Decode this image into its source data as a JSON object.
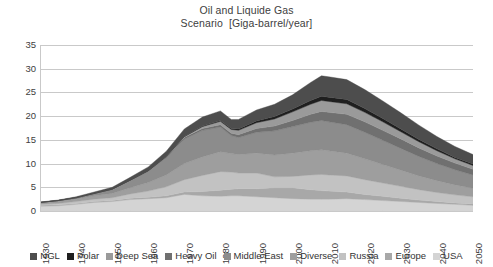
{
  "chart_data": {
    "type": "area",
    "title": "Oil and Liquide Gas",
    "subtitle": "Scenario  [Giga-barrel/year]",
    "xlabel": "",
    "ylabel": "",
    "stacked": true,
    "grid": true,
    "legend_position": "bottom",
    "xlim": [
      1930,
      2050
    ],
    "ylim": [
      0,
      35
    ],
    "yticks": [
      0,
      5,
      10,
      15,
      20,
      25,
      30,
      35
    ],
    "ytick_labels": [
      "0",
      "5",
      "10",
      "15",
      "20",
      "25",
      "30",
      "35"
    ],
    "xticks": [
      1930,
      1940,
      1950,
      1960,
      1970,
      1980,
      1990,
      2000,
      2010,
      2020,
      2030,
      2040,
      2050
    ],
    "xtick_labels": [
      "1930",
      "1940",
      "1950",
      "1960",
      "1970",
      "1980",
      "1990",
      "2000",
      "2010",
      "2020",
      "2030",
      "2040",
      "2050"
    ],
    "x": [
      1930,
      1935,
      1940,
      1945,
      1950,
      1955,
      1960,
      1965,
      1970,
      1975,
      1980,
      1983,
      1985,
      1990,
      1995,
      2000,
      2005,
      2008,
      2010,
      2015,
      2020,
      2025,
      2030,
      2035,
      2040,
      2045,
      2050
    ],
    "series": [
      {
        "name": "USA",
        "color": "#d4d4d4",
        "values": [
          1.0,
          1.1,
          1.4,
          1.8,
          2.0,
          2.4,
          2.6,
          2.8,
          3.5,
          3.2,
          3.1,
          3.2,
          3.2,
          3.0,
          2.8,
          2.6,
          2.5,
          2.5,
          2.5,
          2.6,
          2.4,
          2.2,
          2.0,
          1.8,
          1.6,
          1.4,
          1.2
        ]
      },
      {
        "name": "Europe",
        "color": "#a8a8a8",
        "values": [
          0.2,
          0.2,
          0.2,
          0.2,
          0.2,
          0.3,
          0.3,
          0.4,
          0.5,
          0.9,
          1.3,
          1.4,
          1.5,
          1.7,
          2.1,
          2.3,
          2.0,
          1.8,
          1.7,
          1.4,
          1.1,
          0.9,
          0.7,
          0.5,
          0.4,
          0.3,
          0.3
        ]
      },
      {
        "name": "Russia",
        "color": "#c2c2c2",
        "values": [
          0.2,
          0.3,
          0.4,
          0.5,
          0.6,
          0.9,
          1.3,
          1.9,
          2.6,
          3.4,
          3.9,
          3.6,
          3.3,
          3.3,
          2.3,
          2.4,
          3.1,
          3.4,
          3.4,
          3.4,
          3.1,
          2.8,
          2.5,
          2.2,
          1.9,
          1.7,
          1.5
        ]
      },
      {
        "name": "Diverse",
        "color": "#9e9e9e",
        "values": [
          0.3,
          0.4,
          0.5,
          0.7,
          0.9,
          1.3,
          1.8,
          2.5,
          3.4,
          3.9,
          4.2,
          3.9,
          3.9,
          4.2,
          4.6,
          4.9,
          5.1,
          5.2,
          5.1,
          4.8,
          4.4,
          3.9,
          3.4,
          2.9,
          2.5,
          2.1,
          1.8
        ]
      },
      {
        "name": "Middle East",
        "color": "#8c8c8c",
        "values": [
          0.1,
          0.2,
          0.3,
          0.5,
          0.9,
          1.5,
          2.4,
          3.6,
          5.2,
          5.6,
          5.2,
          3.8,
          3.6,
          4.4,
          5.1,
          5.6,
          6.0,
          6.2,
          6.1,
          6.0,
          5.6,
          5.1,
          4.6,
          4.1,
          3.6,
          3.2,
          2.8
        ]
      },
      {
        "name": "Heavy Oil",
        "color": "#707070",
        "values": [
          0.0,
          0.0,
          0.0,
          0.0,
          0.0,
          0.1,
          0.1,
          0.2,
          0.3,
          0.4,
          0.5,
          0.5,
          0.6,
          0.8,
          1.0,
          1.3,
          1.7,
          1.9,
          2.0,
          2.2,
          2.2,
          2.1,
          2.0,
          1.8,
          1.6,
          1.4,
          1.2
        ]
      },
      {
        "name": "Deep Sea",
        "color": "#9a9a9a",
        "values": [
          0.0,
          0.0,
          0.0,
          0.0,
          0.0,
          0.0,
          0.0,
          0.1,
          0.2,
          0.4,
          0.7,
          0.8,
          0.9,
          1.2,
          1.5,
          1.8,
          2.1,
          2.3,
          2.3,
          2.2,
          2.0,
          1.8,
          1.5,
          1.3,
          1.1,
          0.9,
          0.8
        ]
      },
      {
        "name": "Polar",
        "color": "#1f1f1f",
        "values": [
          0.0,
          0.0,
          0.0,
          0.0,
          0.0,
          0.0,
          0.0,
          0.0,
          0.0,
          0.1,
          0.2,
          0.2,
          0.3,
          0.4,
          0.5,
          0.6,
          0.8,
          0.9,
          0.9,
          0.9,
          0.8,
          0.7,
          0.6,
          0.5,
          0.4,
          0.3,
          0.3
        ]
      },
      {
        "name": "NGL",
        "color": "#4d4d4d",
        "values": [
          0.1,
          0.1,
          0.2,
          0.3,
          0.4,
          0.6,
          0.8,
          1.1,
          1.6,
          1.9,
          2.0,
          1.9,
          2.0,
          2.3,
          2.6,
          3.0,
          3.8,
          4.3,
          4.3,
          4.2,
          4.0,
          3.7,
          3.4,
          3.0,
          2.6,
          2.3,
          2.0
        ]
      }
    ],
    "legend": [
      {
        "label": "NGL",
        "color": "#4d4d4d"
      },
      {
        "label": "Polar",
        "color": "#1f1f1f"
      },
      {
        "label": "Deep Sea",
        "color": "#9a9a9a"
      },
      {
        "label": "Heavy Oil",
        "color": "#707070"
      },
      {
        "label": "Middle East",
        "color": "#8c8c8c"
      },
      {
        "label": "Diverse",
        "color": "#9e9e9e"
      },
      {
        "label": "Russia",
        "color": "#c2c2c2"
      },
      {
        "label": "Europe",
        "color": "#a8a8a8"
      },
      {
        "label": "USA",
        "color": "#d4d4d4"
      }
    ],
    "annotations": {
      "peak_year": 2008,
      "peak_value": 29,
      "dip_year": 1983
    }
  }
}
